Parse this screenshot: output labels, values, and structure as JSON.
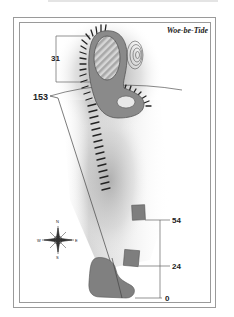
{
  "map": {
    "title": "Woe-be-Tide",
    "labels": {
      "island_height": "31",
      "track_distance": "153",
      "upper_marker": "54",
      "lower_marker": "24",
      "origin_marker": "0"
    },
    "compass": {
      "north": "N",
      "south": "S",
      "east": "E",
      "west": "W"
    },
    "colors": {
      "land": "#8a8a8a",
      "land_stroke": "#555555",
      "shading": "#9a9a9a",
      "hatch": "#b8b8b8",
      "frame": "#9a9a9a",
      "text": "#222222"
    }
  }
}
